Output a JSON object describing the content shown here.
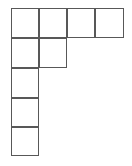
{
  "figure": {
    "kind": "polyomino-grid-diagram",
    "background_color": "#ffffff",
    "line_color": "#585858",
    "line_width_px": 1.5,
    "canvas": {
      "width": 132,
      "height": 166
    },
    "origin": {
      "x": 11,
      "y": 8
    },
    "cell_size": {
      "width": 28,
      "height": 29.6
    },
    "total_cells": 9,
    "rows": [
      {
        "row": 1,
        "cells_in_row": 4,
        "columns": [
          1,
          2,
          3,
          4
        ]
      },
      {
        "row": 2,
        "cells_in_row": 2,
        "columns": [
          1,
          2
        ]
      },
      {
        "row": 3,
        "cells_in_row": 1,
        "columns": [
          1
        ]
      },
      {
        "row": 4,
        "cells_in_row": 1,
        "columns": [
          1
        ]
      },
      {
        "row": 5,
        "cells_in_row": 1,
        "columns": [
          1
        ]
      }
    ],
    "cells": [
      {
        "id": "r1c1",
        "row": 1,
        "col": 1,
        "left": 11,
        "top": 8,
        "width": 28,
        "height": 30
      },
      {
        "id": "r1c2",
        "row": 1,
        "col": 2,
        "left": 39,
        "top": 8,
        "width": 28,
        "height": 30
      },
      {
        "id": "r1c3",
        "row": 1,
        "col": 3,
        "left": 67,
        "top": 8,
        "width": 28,
        "height": 30
      },
      {
        "id": "r1c4",
        "row": 1,
        "col": 4,
        "left": 95,
        "top": 8,
        "width": 29,
        "height": 30
      },
      {
        "id": "r2c1",
        "row": 2,
        "col": 1,
        "left": 11,
        "top": 38,
        "width": 28,
        "height": 30
      },
      {
        "id": "r2c2",
        "row": 2,
        "col": 2,
        "left": 39,
        "top": 38,
        "width": 28,
        "height": 30
      },
      {
        "id": "r3c1",
        "row": 3,
        "col": 1,
        "left": 11,
        "top": 68,
        "width": 28,
        "height": 30
      },
      {
        "id": "r4c1",
        "row": 4,
        "col": 1,
        "left": 11,
        "top": 98,
        "width": 28,
        "height": 29
      },
      {
        "id": "r5c1",
        "row": 5,
        "col": 1,
        "left": 11,
        "top": 127,
        "width": 28,
        "height": 29
      }
    ]
  }
}
